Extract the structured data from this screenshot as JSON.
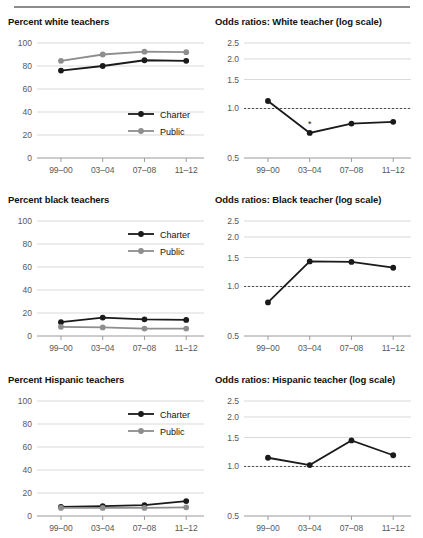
{
  "figure": {
    "width": 423,
    "height": 538,
    "background": "#ffffff",
    "rule_color": "#8c8c8c"
  },
  "colors": {
    "charter": "#1a1a1a",
    "public": "#8e8e8e",
    "grid": "#d9d9d9",
    "axis": "#9a9a9a",
    "refline": "#4d4d4d"
  },
  "legend": {
    "charter_label": "Charter",
    "public_label": "Public"
  },
  "axis": {
    "x_categories": [
      "99–00",
      "03–04",
      "07–08",
      "11–12"
    ],
    "percent_yticks": [
      "0",
      "20",
      "40",
      "60",
      "80",
      "100"
    ],
    "odds_yticks": [
      "0.5",
      "1.0",
      "1.5",
      "2.0",
      "2.5"
    ]
  },
  "chart_data": [
    {
      "id": "percent-white-teachers",
      "type": "line",
      "title": "Percent white teachers",
      "xlabel": "",
      "ylabel": "",
      "categories": [
        "99–00",
        "03–04",
        "07–08",
        "11–12"
      ],
      "ylim": [
        0,
        100
      ],
      "yticks": [
        0,
        20,
        40,
        60,
        80,
        100
      ],
      "grid": true,
      "legend": "inside-right",
      "series": [
        {
          "name": "Charter",
          "values": [
            76,
            80,
            85,
            84.5
          ]
        },
        {
          "name": "Public",
          "values": [
            84.5,
            90,
            92.5,
            92
          ]
        }
      ]
    },
    {
      "id": "odds-ratios-white-teacher",
      "type": "line",
      "title": "Odds ratios: White teacher (log scale)",
      "xlabel": "",
      "ylabel": "",
      "categories": [
        "99–00",
        "03–04",
        "07–08",
        "11–12"
      ],
      "ylim": [
        0.5,
        2.5
      ],
      "yticks": [
        0.5,
        1.0,
        1.5,
        2.0,
        2.5
      ],
      "scale": "log",
      "grid": true,
      "reference_line": 1.0,
      "legend": "none",
      "annotations": [
        {
          "category": "03–04",
          "text": "*"
        }
      ],
      "series": [
        {
          "name": "Odds ratio",
          "values": [
            1.11,
            0.71,
            0.81,
            0.83
          ]
        }
      ]
    },
    {
      "id": "percent-black-teachers",
      "type": "line",
      "title": "Percent black teachers",
      "xlabel": "",
      "ylabel": "",
      "categories": [
        "99–00",
        "03–04",
        "07–08",
        "11–12"
      ],
      "ylim": [
        0,
        100
      ],
      "yticks": [
        0,
        20,
        40,
        60,
        80,
        100
      ],
      "grid": true,
      "legend": "inside-right",
      "series": [
        {
          "name": "Charter",
          "values": [
            12,
            16,
            14.5,
            14
          ]
        },
        {
          "name": "Public",
          "values": [
            8,
            7.5,
            6.5,
            6.5
          ]
        }
      ]
    },
    {
      "id": "odds-ratios-black-teacher",
      "type": "line",
      "title": "Odds ratios: Black teacher (log scale)",
      "xlabel": "",
      "ylabel": "",
      "categories": [
        "99–00",
        "03–04",
        "07–08",
        "11–12"
      ],
      "ylim": [
        0.5,
        2.5
      ],
      "yticks": [
        0.5,
        1.0,
        1.5,
        2.0,
        2.5
      ],
      "scale": "log",
      "grid": true,
      "reference_line": 1.0,
      "legend": "none",
      "series": [
        {
          "name": "Odds ratio",
          "values": [
            0.8,
            1.42,
            1.41,
            1.3
          ]
        }
      ]
    },
    {
      "id": "percent-hispanic-teachers",
      "type": "line",
      "title": "Percent Hispanic teachers",
      "xlabel": "",
      "ylabel": "",
      "categories": [
        "99–00",
        "03–04",
        "07–08",
        "11–12"
      ],
      "ylim": [
        0,
        100
      ],
      "yticks": [
        0,
        20,
        40,
        60,
        80,
        100
      ],
      "grid": true,
      "legend": "inside-right",
      "series": [
        {
          "name": "Charter",
          "values": [
            8,
            8.5,
            9.5,
            13
          ]
        },
        {
          "name": "Public",
          "values": [
            7,
            7,
            7,
            7.5
          ]
        }
      ]
    },
    {
      "id": "odds-ratios-hispanic-teacher",
      "type": "line",
      "title": "Odds ratios: Hispanic teacher (log scale)",
      "xlabel": "",
      "ylabel": "",
      "categories": [
        "99–00",
        "03–04",
        "07–08",
        "11–12"
      ],
      "ylim": [
        0.5,
        2.5
      ],
      "yticks": [
        0.5,
        1.0,
        1.5,
        2.0,
        2.5
      ],
      "scale": "log",
      "grid": true,
      "reference_line": 1.0,
      "legend": "none",
      "series": [
        {
          "name": "Odds ratio",
          "values": [
            1.13,
            1.02,
            1.44,
            1.17
          ]
        }
      ]
    }
  ]
}
